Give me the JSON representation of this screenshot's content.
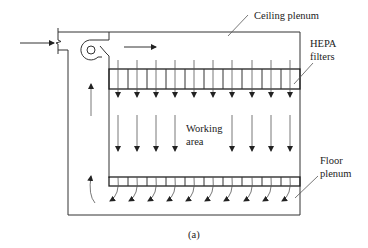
{
  "figure": {
    "caption": "(a)"
  },
  "labels": {
    "ceiling_plenum": "Ceiling plenum",
    "hepa_line1": "HEPA",
    "hepa_line2": "filters",
    "working_line1": "Working",
    "working_line2": "area",
    "floor_line1": "Floor",
    "floor_line2": "plenum"
  },
  "components": {
    "inlet": "air-inlet",
    "fan": "blower-fan",
    "hepa_filter_cells": 10,
    "floor_grate_cells": 10,
    "downflow_arrows_filter": 10,
    "downflow_arrows_working_area": 8,
    "floor_curved_arrows": 10,
    "return_arrows": 2
  },
  "colors": {
    "line": "#333333",
    "text": "#222222",
    "background": "#ffffff"
  }
}
